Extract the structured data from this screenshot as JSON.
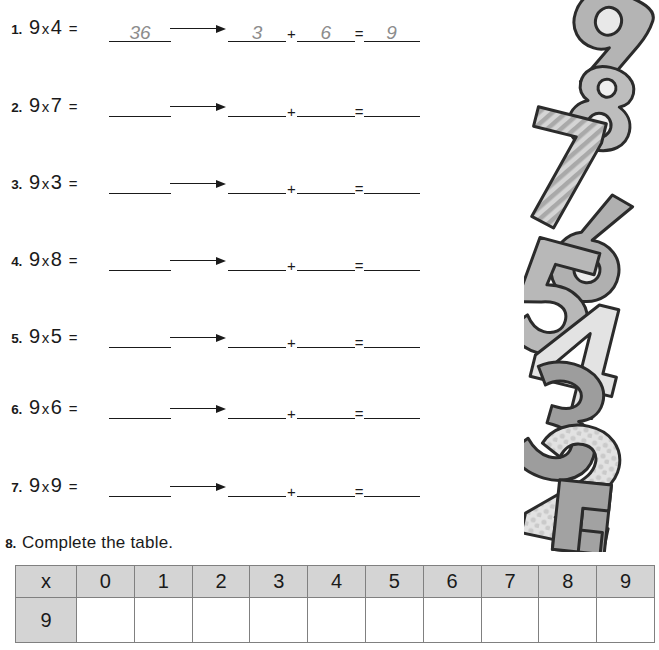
{
  "worksheet": {
    "pattern_note": "nine times table digit-sum decomposition",
    "multiplier": "9",
    "operator": "x",
    "equals": "=",
    "plus": "+",
    "arrow_icon": "right-arrow-icon"
  },
  "problems": [
    {
      "number": "1.",
      "factor_a": "9",
      "factor_b": "4",
      "product": "36",
      "tens": "3",
      "ones": "6",
      "sum": "9"
    },
    {
      "number": "2.",
      "factor_a": "9",
      "factor_b": "7",
      "product": "",
      "tens": "",
      "ones": "",
      "sum": ""
    },
    {
      "number": "3.",
      "factor_a": "9",
      "factor_b": "3",
      "product": "",
      "tens": "",
      "ones": "",
      "sum": ""
    },
    {
      "number": "4.",
      "factor_a": "9",
      "factor_b": "8",
      "product": "",
      "tens": "",
      "ones": "",
      "sum": ""
    },
    {
      "number": "5.",
      "factor_a": "9",
      "factor_b": "5",
      "product": "",
      "tens": "",
      "ones": "",
      "sum": ""
    },
    {
      "number": "6.",
      "factor_a": "9",
      "factor_b": "6",
      "product": "",
      "tens": "",
      "ones": "",
      "sum": ""
    },
    {
      "number": "7.",
      "factor_a": "9",
      "factor_b": "9",
      "product": "",
      "tens": "",
      "ones": "",
      "sum": ""
    }
  ],
  "task8": {
    "number": "8.",
    "text": "Complete the table."
  },
  "table": {
    "header": [
      "x",
      "0",
      "1",
      "2",
      "3",
      "4",
      "5",
      "6",
      "7",
      "8",
      "9"
    ],
    "row_label": "9",
    "row_values": [
      "",
      "",
      "",
      "",
      "",
      "",
      "",
      "",
      "",
      ""
    ]
  },
  "decoration": {
    "name": "stacked-numbers-illustration",
    "digits": [
      "9",
      "8",
      "7",
      "6",
      "5",
      "4",
      "3",
      "2",
      "1"
    ],
    "colors": {
      "light": "#cfcfcf",
      "mid": "#a8a8a8",
      "dark": "#8a8a8a",
      "outline": "#2b2b2b"
    }
  }
}
